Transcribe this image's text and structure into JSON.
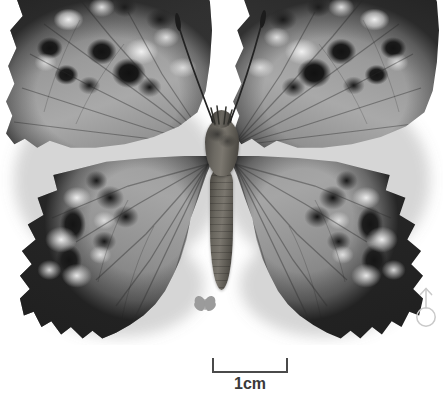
{
  "plate": {
    "kind": "butterfly-specimen-photograph",
    "background_color": "#ffffff",
    "width_px": 443,
    "height_px": 405,
    "color_mode": "grayscale"
  },
  "specimen": {
    "name": "pinned-butterfly-specimen",
    "view": "dorsal",
    "description": "Grayscale dorsal view of a spread butterfly specimen with dark-spotted forewings and scalloped hindwings",
    "ground_color": "#a0a0a0",
    "spot_color": "#141414",
    "pale_patch_color": "#f4f4f4",
    "body_color": "#605d56",
    "parts": {
      "left_forewing": "left-forewing",
      "right_forewing": "right-forewing",
      "left_hindwing": "left-hindwing",
      "right_hindwing": "right-hindwing",
      "head": "head",
      "thorax": "thorax",
      "abdomen": "abdomen",
      "left_antenna": "left-antenna",
      "right_antenna": "right-antenna"
    }
  },
  "scale_bar": {
    "label": "1cm",
    "value": 1,
    "unit": "cm",
    "bar_color": "#4a4a4a",
    "label_color": "#3a3a3a",
    "pixel_length": 76,
    "style": "bracket-with-end-ticks"
  },
  "sex_symbol": {
    "name": "male-symbol",
    "glyph": "♂",
    "meaning": "male",
    "color": "#c9c9c9"
  },
  "scale_icon": {
    "name": "butterfly-silhouette-icon",
    "meaning": "life-size-reference-silhouette",
    "color": "#9a9a9a"
  }
}
